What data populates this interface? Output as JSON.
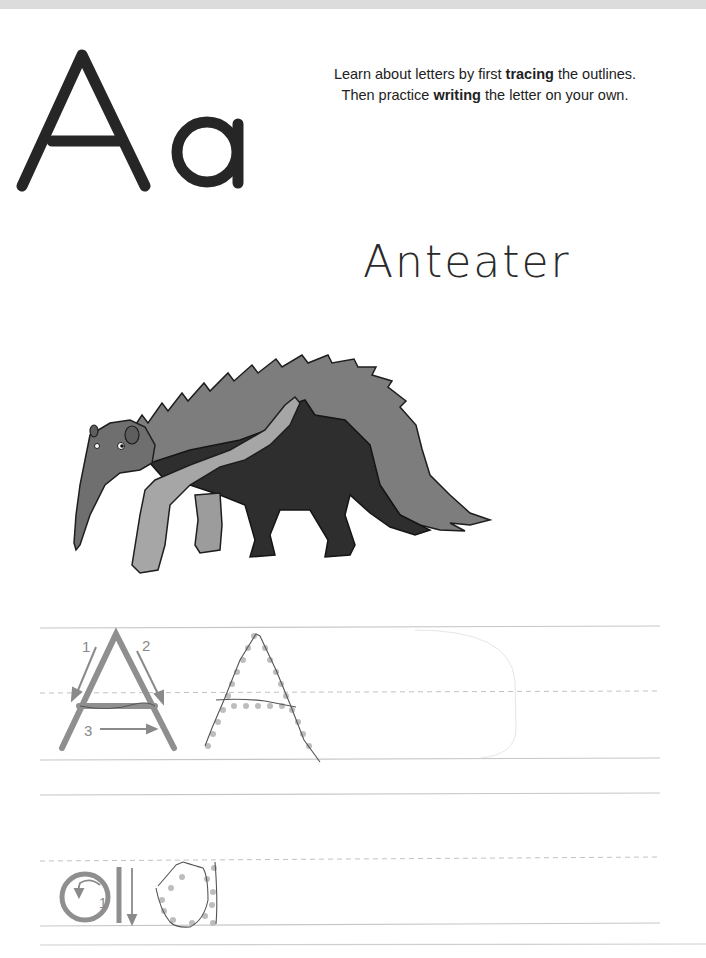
{
  "worksheet": {
    "letter_upper": "A",
    "letter_lower": "a",
    "instructions": {
      "line1_pre": "Learn about letters by first ",
      "line1_bold": "tracing",
      "line1_post": " the outlines.",
      "line2_pre": "Then practice ",
      "line2_bold": "writing",
      "line2_post": " the letter on your own."
    },
    "word": "Anteater",
    "illustration": "anteater-illustration",
    "practice_rows": [
      {
        "letter": "A",
        "stroke_numbers": [
          "1",
          "2",
          "3"
        ],
        "traced_examples": 1
      },
      {
        "letter": "a",
        "stroke_numbers": [
          "1"
        ],
        "traced_examples": 1
      }
    ]
  },
  "colors": {
    "ink": "#222222",
    "guide_stroke": "#8a8a8a",
    "dot": "#b5b5b5",
    "rule_line": "#c8c8c8",
    "animal_light": "#8f8f8f",
    "animal_mid": "#6a6a6a",
    "animal_dark": "#2c2c2c",
    "animal_pale": "#a9a9a9"
  }
}
